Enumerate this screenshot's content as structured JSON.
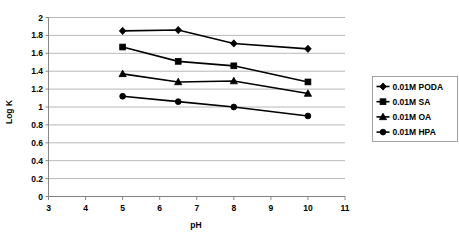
{
  "chart_data": {
    "type": "line",
    "title": "",
    "xlabel": "pH",
    "ylabel": "Log K",
    "xlim": [
      3,
      11
    ],
    "ylim": [
      0,
      2
    ],
    "xticks": [
      3,
      4,
      5,
      6,
      7,
      8,
      9,
      10,
      11
    ],
    "yticks": [
      0,
      0.2,
      0.4,
      0.6,
      0.8,
      1,
      1.2,
      1.4,
      1.6,
      1.8,
      2
    ],
    "xtick_labels": [
      "3",
      "4",
      "5",
      "6",
      "7",
      "8",
      "9",
      "10",
      "11"
    ],
    "ytick_labels": [
      "0",
      "0.2",
      "0.4",
      "0.6",
      "0.8",
      "1",
      "1.2",
      "1.4",
      "1.6",
      "1.8",
      "2"
    ],
    "grid": "horizontal",
    "legend_position": "right",
    "x": [
      5,
      6.5,
      8,
      10
    ],
    "series": [
      {
        "name": "0.01M PODA",
        "marker": "diamond",
        "values": [
          1.85,
          1.86,
          1.71,
          1.65
        ]
      },
      {
        "name": "0.01M SA",
        "marker": "square",
        "values": [
          1.67,
          1.51,
          1.46,
          1.28
        ]
      },
      {
        "name": "0.01M OA",
        "marker": "triangle",
        "values": [
          1.37,
          1.28,
          1.29,
          1.15
        ]
      },
      {
        "name": "0.01M HPA",
        "marker": "circle",
        "values": [
          1.12,
          1.06,
          1.0,
          0.9
        ]
      }
    ]
  },
  "legend": {
    "items": [
      {
        "label": "0.01M PODA",
        "marker": "diamond"
      },
      {
        "label": "0.01M SA",
        "marker": "square"
      },
      {
        "label": "0.01M OA",
        "marker": "triangle"
      },
      {
        "label": "0.01M HPA",
        "marker": "circle"
      }
    ]
  },
  "axes": {
    "x_title": "pH",
    "y_title": "Log K"
  },
  "colors": {
    "series": "#000000",
    "grid": "#9a9a9a",
    "axis": "#7a7a7a",
    "background": "#ffffff"
  }
}
